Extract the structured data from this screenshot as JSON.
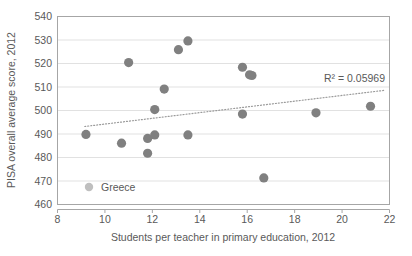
{
  "chart_data": {
    "type": "scatter",
    "title": "",
    "xlabel": "Students per teacher in primary education, 2012",
    "ylabel": "PISA overall average score, 2012",
    "xlim": [
      8,
      22
    ],
    "ylim": [
      460,
      540
    ],
    "xticks": [
      "8",
      "10",
      "12",
      "14",
      "16",
      "18",
      "20",
      "22"
    ],
    "yticks": [
      "460",
      "470",
      "480",
      "490",
      "500",
      "510",
      "520",
      "530",
      "540"
    ],
    "grid": "horizontal",
    "legend": {
      "position": "inside-bottom-left",
      "entries": [
        {
          "label": "Greece",
          "marker_color": "#bfbfbf"
        }
      ]
    },
    "annotations": [
      {
        "name": "r-squared",
        "text": "R² = 0.05969",
        "x": 20.0,
        "y": 514.5
      }
    ],
    "series": [
      {
        "name": "Greece",
        "marker_color": "#808080",
        "points": [
          {
            "x": 9.2,
            "y": 489.8
          },
          {
            "x": 10.7,
            "y": 486.1
          },
          {
            "x": 11.0,
            "y": 520.4
          },
          {
            "x": 11.8,
            "y": 488.1
          },
          {
            "x": 11.8,
            "y": 481.8
          },
          {
            "x": 12.1,
            "y": 489.6
          },
          {
            "x": 12.1,
            "y": 500.4
          },
          {
            "x": 12.5,
            "y": 509.1
          },
          {
            "x": 13.1,
            "y": 525.9
          },
          {
            "x": 13.5,
            "y": 529.6
          },
          {
            "x": 13.5,
            "y": 489.6
          },
          {
            "x": 15.8,
            "y": 518.4
          },
          {
            "x": 15.8,
            "y": 498.5
          },
          {
            "x": 16.1,
            "y": 515.2
          },
          {
            "x": 16.2,
            "y": 514.9
          },
          {
            "x": 16.7,
            "y": 471.3
          },
          {
            "x": 18.9,
            "y": 499.0
          },
          {
            "x": 21.2,
            "y": 501.8
          }
        ]
      }
    ],
    "trendline": {
      "name": "linear-trendline",
      "style": "dotted",
      "color": "#9a9a9a",
      "x_start": 9.15,
      "y_start": 493.2,
      "x_end": 21.8,
      "y_end": 508.6
    }
  }
}
